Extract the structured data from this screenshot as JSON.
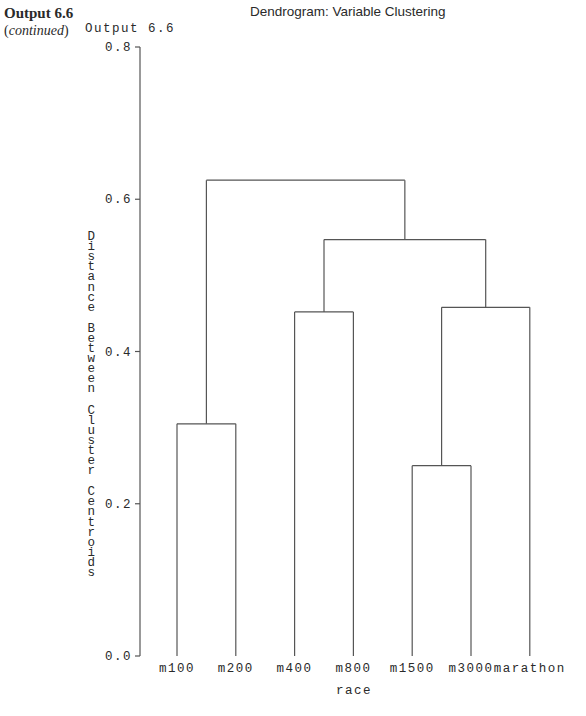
{
  "book": {
    "label": "Output 6.6",
    "continued": "continued"
  },
  "output_label": "Output 6.6",
  "chart_data": {
    "type": "dendrogram",
    "title": "Dendrogram: Variable Clustering",
    "xlabel": "race",
    "ylabel": "Distance Between Cluster Centroids",
    "ylim": [
      0.0,
      0.8
    ],
    "yticks": [
      "0.0",
      "0.2",
      "0.4",
      "0.6",
      "0.8"
    ],
    "leaves": [
      "m100",
      "m200",
      "m400",
      "m800",
      "m1500",
      "m3000",
      "marathon"
    ],
    "merges": [
      {
        "left": "m1500",
        "right": "m3000",
        "height": 0.25
      },
      {
        "left": "m100",
        "right": "m200",
        "height": 0.305
      },
      {
        "left": "m400",
        "right": "m800",
        "height": 0.452
      },
      {
        "left": "(m1500,m3000)",
        "right": "marathon",
        "height": 0.458
      },
      {
        "left": "(m400,m800)",
        "right": "(m1500,m3000,marathon)",
        "height": 0.547
      },
      {
        "left": "(m100,m200)",
        "right": "(m400,m800,m1500,m3000,marathon)",
        "height": 0.625
      }
    ],
    "grid": false,
    "legend": null
  }
}
